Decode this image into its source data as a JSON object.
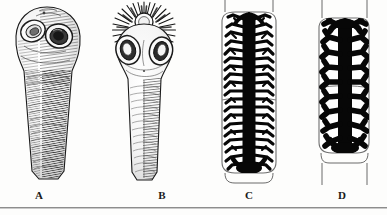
{
  "figure": {
    "type": "scientific-illustration-plate",
    "background_color": "#fdfdfc",
    "ink_color": "#1b1b1b",
    "width": 387,
    "height": 215,
    "baseline_rule_color": "#8d8d8d"
  },
  "panels": [
    {
      "id": "A",
      "label": "A",
      "label_x": 39,
      "subject": "tapeworm-scolex-unarmed",
      "description": "Scolex with two large lateral suckers and no rostellar hooks, tapering into a hatched neck",
      "suckers": 2,
      "has_rostellum": false,
      "has_hooks": false,
      "shading": "fine-cross-hatching"
    },
    {
      "id": "B",
      "label": "B",
      "label_x": 162,
      "subject": "tapeworm-scolex-armed",
      "description": "Scolex with two suckers and an apical rostellum bearing a crown of radiating hooks, narrow neck below",
      "suckers": 2,
      "has_rostellum": true,
      "has_hooks": true,
      "hook_count": 30,
      "shading": "fine-cross-hatching"
    },
    {
      "id": "C",
      "label": "C",
      "label_x": 249,
      "subject": "gravid-proglottid-many-branches",
      "description": "Gravid proglottid showing a central longitudinal uterine stem with numerous fine lateral branches",
      "uterine_branches_per_side": 18,
      "branch_character": "numerous, slender, closely set",
      "fill": "solid-black-uterus"
    },
    {
      "id": "D",
      "label": "D",
      "label_x": 342,
      "subject": "gravid-proglottid-few-branches",
      "description": "Gravid proglottid showing a central longitudinal uterine stem with few thick dichotomous lateral branches",
      "uterine_branches_per_side": 9,
      "branch_character": "few, stout, widely spaced",
      "fill": "solid-black-uterus"
    }
  ]
}
